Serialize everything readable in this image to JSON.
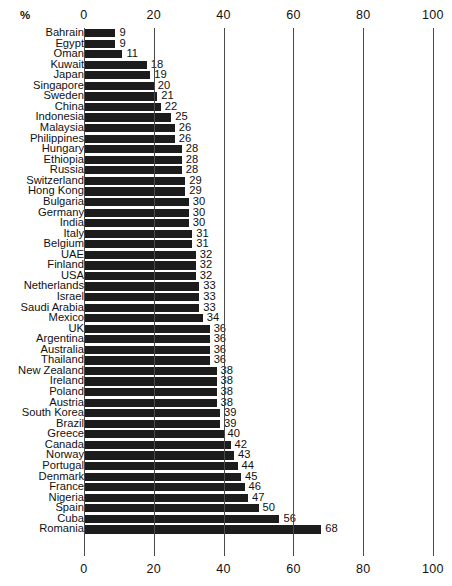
{
  "chart": {
    "axis_unit_label": "%",
    "x_ticks": [
      0,
      20,
      40,
      60,
      80,
      100
    ],
    "x_tick_labels": [
      "0",
      "20",
      "40",
      "60",
      "80",
      "100"
    ]
  },
  "chart_data": {
    "type": "bar",
    "orientation": "horizontal",
    "title": "",
    "subtitle": "",
    "xlabel": "%",
    "ylabel": "",
    "xlim": [
      0,
      100
    ],
    "grid": true,
    "legend": null,
    "axis_top": true,
    "axis_bottom": true,
    "bar_color": "#1c1c1c",
    "categories": [
      "Bahrain",
      "Egypt",
      "Oman",
      "Kuwait",
      "Japan",
      "Singapore",
      "Sweden",
      "China",
      "Indonesia",
      "Malaysia",
      "Philippines",
      "Hungary",
      "Ethiopia",
      "Russia",
      "Switzerland",
      "Hong Kong",
      "Bulgaria",
      "Germany",
      "India",
      "Italy",
      "Belgium",
      "UAE",
      "Finland",
      "USA",
      "Netherlands",
      "Israel",
      "Saudi Arabia",
      "Mexico",
      "UK",
      "Argentina",
      "Australia",
      "Thailand",
      "New Zealand",
      "Ireland",
      "Poland",
      "Austria",
      "South Korea",
      "Brazil",
      "Greece",
      "Canada",
      "Norway",
      "Portugal",
      "Denmark",
      "France",
      "Nigeria",
      "Spain",
      "Cuba",
      "Romania"
    ],
    "values": [
      9,
      9,
      11,
      18,
      19,
      20,
      21,
      22,
      25,
      26,
      26,
      28,
      28,
      28,
      29,
      29,
      30,
      30,
      30,
      31,
      31,
      32,
      32,
      32,
      33,
      33,
      33,
      34,
      36,
      36,
      36,
      36,
      38,
      38,
      38,
      38,
      39,
      39,
      40,
      42,
      43,
      44,
      45,
      46,
      47,
      50,
      56,
      68
    ],
    "value_labels": [
      "9",
      "9",
      "11",
      "18",
      "19",
      "20",
      "21",
      "22",
      "25",
      "26",
      "26",
      "28",
      "28",
      "28",
      "29",
      "29",
      "30",
      "30",
      "30",
      "31",
      "31",
      "32",
      "32",
      "32",
      "33",
      "33",
      "33",
      "34",
      "36",
      "36",
      "36",
      "36",
      "38",
      "38",
      "38",
      "38",
      "39",
      "39",
      "40",
      "42",
      "43",
      "44",
      "45",
      "46",
      "47",
      "50",
      "56",
      "68"
    ]
  }
}
